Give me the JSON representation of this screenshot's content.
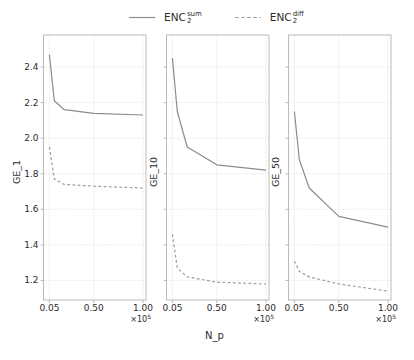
{
  "figure": {
    "background": "#ffffff",
    "width": 414,
    "height": 360
  },
  "legend": {
    "items": [
      {
        "base": "ENC",
        "sub": "2",
        "sup": "sum",
        "line_style": "solid",
        "color": "#8c8c8c"
      },
      {
        "base": "ENC",
        "sub": "2",
        "sup": "diff",
        "line_style": "dashed",
        "color": "#9c9c9c"
      }
    ]
  },
  "axes": {
    "xlabel": "N_p",
    "xtick_labels": [
      "0.05",
      "0.50",
      "1.00"
    ],
    "xtick_values": [
      0.05,
      0.5,
      1.0
    ],
    "ytick_labels": [
      "1.2",
      "1.4",
      "1.6",
      "1.8",
      "2.0",
      "2.2",
      "2.4"
    ],
    "ytick_values": [
      1.2,
      1.4,
      1.6,
      1.8,
      2.0,
      2.2,
      2.4
    ],
    "x_offset": {
      "base": "×10",
      "exp": "5"
    },
    "xlim": [
      -0.01,
      1.03
    ],
    "ylim": [
      1.09,
      2.58
    ],
    "grid": true,
    "colors": {
      "solid_line": "#8c8c8c",
      "dashed_line": "#9c9c9c",
      "grid": "#d6d6d6",
      "spine": "#b3b3b3",
      "text": "#2b2b2b"
    }
  },
  "chart_data": [
    {
      "type": "line",
      "ylabel": "GE_1",
      "x": [
        0.05,
        0.1,
        0.2,
        0.5,
        1.0
      ],
      "x_unit": "×10⁵",
      "series": [
        {
          "name": "ENC2_sum",
          "style": "solid",
          "values": [
            2.47,
            2.21,
            2.16,
            2.14,
            2.13
          ]
        },
        {
          "name": "ENC2_diff",
          "style": "dashed",
          "values": [
            1.95,
            1.77,
            1.74,
            1.73,
            1.72
          ]
        }
      ],
      "show_ytick_labels": true
    },
    {
      "type": "line",
      "ylabel": "GE_10",
      "x": [
        0.05,
        0.1,
        0.2,
        0.5,
        1.0
      ],
      "x_unit": "×10⁵",
      "series": [
        {
          "name": "ENC2_sum",
          "style": "solid",
          "values": [
            2.45,
            2.15,
            1.95,
            1.85,
            1.82
          ]
        },
        {
          "name": "ENC2_diff",
          "style": "dashed",
          "values": [
            1.46,
            1.27,
            1.22,
            1.19,
            1.18
          ]
        }
      ],
      "show_ytick_labels": false
    },
    {
      "type": "line",
      "ylabel": "GE_50",
      "x": [
        0.05,
        0.1,
        0.2,
        0.5,
        1.0
      ],
      "x_unit": "×10⁵",
      "series": [
        {
          "name": "ENC2_sum",
          "style": "solid",
          "values": [
            2.15,
            1.88,
            1.72,
            1.56,
            1.5
          ]
        },
        {
          "name": "ENC2_diff",
          "style": "dashed",
          "values": [
            1.31,
            1.25,
            1.22,
            1.18,
            1.14
          ]
        }
      ],
      "show_ytick_labels": false
    }
  ]
}
